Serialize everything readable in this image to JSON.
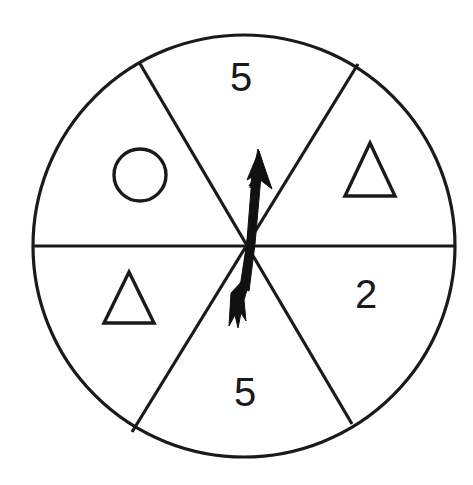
{
  "figure": {
    "background_color": "#ffffff",
    "ink_color": "#1a1a1a"
  },
  "wheel": {
    "center_x": 244,
    "center_y": 246,
    "radius": 211,
    "sector_count": 6
  },
  "sectors": [
    {
      "id": "sector-top",
      "position": "top",
      "content_type": "number",
      "label": "5",
      "label_x": 241,
      "label_y": 78,
      "start_angle_deg": 58,
      "end_angle_deg": 120
    },
    {
      "id": "sector-upper-right",
      "position": "upper-right",
      "content_type": "shape",
      "shape": "triangle",
      "label": "",
      "shape_cx": 370,
      "shape_cy": 172,
      "start_angle_deg": 0,
      "end_angle_deg": 58
    },
    {
      "id": "sector-lower-right",
      "position": "lower-right",
      "content_type": "number",
      "label": "2",
      "label_x": 366,
      "label_y": 295,
      "start_angle_deg": -61,
      "end_angle_deg": 0
    },
    {
      "id": "sector-bottom",
      "position": "bottom",
      "content_type": "number",
      "label": "5",
      "label_x": 245,
      "label_y": 393,
      "start_angle_deg": -118,
      "end_angle_deg": -61
    },
    {
      "id": "sector-lower-left",
      "position": "lower-left",
      "content_type": "shape",
      "shape": "triangle",
      "label": "",
      "shape_cx": 129,
      "shape_cy": 299,
      "start_angle_deg": -180,
      "end_angle_deg": -118
    },
    {
      "id": "sector-upper-left",
      "position": "upper-left",
      "content_type": "shape",
      "shape": "circle",
      "label": "",
      "shape_cx": 140,
      "shape_cy": 175,
      "start_angle_deg": 120,
      "end_angle_deg": 180
    }
  ],
  "glyphs": {
    "circle": {
      "cx": 140,
      "cy": 175,
      "r": 26
    },
    "triangle_right": {
      "apex_x": 370,
      "apex_y": 143,
      "left_x": 345,
      "left_y": 196,
      "right_x": 395,
      "right_y": 196
    },
    "triangle_left": {
      "apex_x": 129,
      "apex_y": 272,
      "left_x": 104,
      "left_y": 323,
      "right_x": 154,
      "right_y": 323
    }
  },
  "dividers": [
    {
      "id": "divider-horizontal",
      "x1": 33,
      "y1": 246,
      "x2": 455,
      "y2": 246
    },
    {
      "id": "divider-upper-left-lower-right",
      "x1": 139,
      "y1": 62,
      "x2": 352,
      "y2": 424
    },
    {
      "id": "divider-upper-right-lower-left",
      "x1": 358,
      "y1": 64,
      "x2": 132,
      "y2": 432
    }
  ],
  "pointer": {
    "name": "spinner-arrow",
    "color": "#111111",
    "tip_x": 258,
    "tip_y": 150,
    "tail_x": 231,
    "tail_y": 326,
    "points_to_sector": "sector-top",
    "description": "Black arrow pivoting at wheel center, tip angled up-right into the top sector"
  }
}
